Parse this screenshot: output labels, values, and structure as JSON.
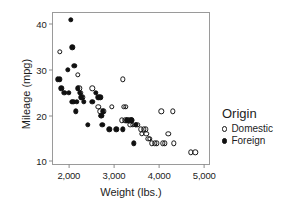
{
  "chart_data": {
    "type": "scatter",
    "title": "",
    "xlabel": "Weight (lbs.)",
    "ylabel": "Mileage (mpg)",
    "xlim": [
      1650,
      5150
    ],
    "ylim": [
      9,
      42.5
    ],
    "xticks": [
      2000,
      3000,
      4000,
      5000
    ],
    "xticklabels": [
      "2,000",
      "3,000",
      "4,000",
      "5,000"
    ],
    "yticks": [
      10,
      20,
      30,
      40
    ],
    "yticklabels": [
      "10",
      "20",
      "30",
      "40"
    ],
    "grid": false,
    "legend": {
      "title": "Origin",
      "position": "right",
      "entries": [
        {
          "label": "Domestic",
          "marker": "open-circle",
          "color": "#151515"
        },
        {
          "label": "Foreign",
          "marker": "filled-circle",
          "color": "#101010"
        }
      ]
    },
    "series": [
      {
        "name": "Domestic",
        "marker": "open-circle",
        "points": [
          [
            1800,
            34
          ],
          [
            2200,
            29
          ],
          [
            2230,
            26
          ],
          [
            2260,
            25
          ],
          [
            2300,
            24
          ],
          [
            2520,
            26
          ],
          [
            2650,
            22
          ],
          [
            2700,
            21
          ],
          [
            2720,
            20
          ],
          [
            2780,
            21
          ],
          [
            2950,
            22
          ],
          [
            3200,
            28
          ],
          [
            3220,
            22
          ],
          [
            3260,
            22
          ],
          [
            3180,
            19
          ],
          [
            3250,
            19
          ],
          [
            3300,
            19
          ],
          [
            3340,
            19
          ],
          [
            3360,
            18
          ],
          [
            3400,
            19
          ],
          [
            3420,
            18
          ],
          [
            3480,
            18
          ],
          [
            3520,
            18
          ],
          [
            3600,
            17
          ],
          [
            3620,
            16
          ],
          [
            3660,
            17
          ],
          [
            3700,
            17
          ],
          [
            3720,
            16
          ],
          [
            3760,
            15
          ],
          [
            3800,
            15
          ],
          [
            3840,
            14
          ],
          [
            3900,
            14
          ],
          [
            3950,
            14
          ],
          [
            4050,
            21
          ],
          [
            4080,
            14
          ],
          [
            4130,
            14
          ],
          [
            4200,
            16
          ],
          [
            4300,
            21
          ],
          [
            4330,
            14
          ],
          [
            4700,
            12
          ],
          [
            4800,
            12
          ]
        ]
      },
      {
        "name": "Foreign",
        "marker": "filled-circle",
        "points": [
          [
            1760,
            28
          ],
          [
            1800,
            28
          ],
          [
            1830,
            26
          ],
          [
            1900,
            25
          ],
          [
            1980,
            30
          ],
          [
            2000,
            25
          ],
          [
            2040,
            41
          ],
          [
            2060,
            23
          ],
          [
            2080,
            35
          ],
          [
            2100,
            23
          ],
          [
            2120,
            31
          ],
          [
            2150,
            21
          ],
          [
            2180,
            23
          ],
          [
            2200,
            26
          ],
          [
            2240,
            25
          ],
          [
            2280,
            24
          ],
          [
            2330,
            23
          ],
          [
            2420,
            18
          ],
          [
            2520,
            23
          ],
          [
            2600,
            25
          ],
          [
            2650,
            24
          ],
          [
            2700,
            24
          ],
          [
            2720,
            20
          ],
          [
            2740,
            18
          ],
          [
            2760,
            21
          ],
          [
            2900,
            17
          ],
          [
            3050,
            17
          ],
          [
            3200,
            17
          ],
          [
            3280,
            19
          ],
          [
            3380,
            19
          ],
          [
            3400,
            19
          ],
          [
            3440,
            14
          ],
          [
            3480,
            18
          ]
        ]
      }
    ]
  }
}
